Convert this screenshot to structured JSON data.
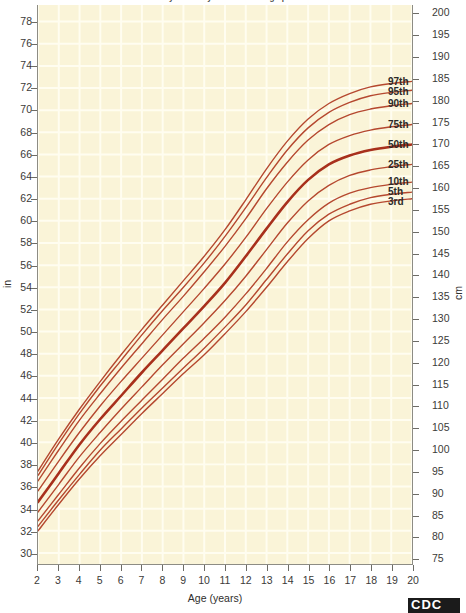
{
  "header": {
    "title": "2 to 20 years: Boys Stature-for-age percentiles",
    "logo_text": "CDC"
  },
  "axes": {
    "x_title": "Age (years)",
    "x_ticks": [
      2,
      3,
      4,
      5,
      6,
      7,
      8,
      9,
      10,
      11,
      12,
      13,
      14,
      15,
      16,
      17,
      18,
      19,
      20
    ],
    "x_min": 2,
    "x_max": 20,
    "left_unit": "in",
    "left_ticks": [
      78,
      76,
      74,
      72,
      70,
      68,
      66,
      64,
      62,
      60,
      58,
      56,
      54,
      52,
      50,
      48,
      46,
      44,
      42,
      40,
      38,
      36,
      34,
      32,
      30
    ],
    "left_min": 29,
    "left_max": 79.5,
    "right_unit": "cm",
    "right_ticks": [
      200,
      195,
      190,
      185,
      180,
      175,
      170,
      165,
      160,
      155,
      150,
      145,
      140,
      135,
      130,
      125,
      120,
      115,
      110,
      105,
      100,
      95,
      90,
      85,
      80,
      75
    ],
    "right_min": 73.7,
    "right_max": 201.9
  },
  "style": {
    "plot_background": "#faf4d8",
    "grid_color": "#fffdf0",
    "curve_color": "#b5482f",
    "curve_color_median": "#a8301c",
    "frame_color": "#8d8c84",
    "text_color": "#2f2e2c"
  },
  "chart_data": {
    "type": "line",
    "title": "2 to 20 years: Boys Stature-for-age percentiles",
    "xlabel": "Age (years)",
    "ylabel": "in",
    "ylabel_secondary": "cm",
    "xlim": [
      2,
      20
    ],
    "ylim": [
      29,
      79.5
    ],
    "grid": true,
    "legend": "inline-right",
    "x": [
      2,
      3,
      4,
      5,
      6,
      7,
      8,
      9,
      10,
      11,
      12,
      13,
      14,
      15,
      16,
      17,
      18,
      19,
      20
    ],
    "series": [
      {
        "name": "97th",
        "label": "97th",
        "emphasis": false,
        "values": [
          37.4,
          40.3,
          43.0,
          45.5,
          47.9,
          50.2,
          52.4,
          54.6,
          56.8,
          59.2,
          61.9,
          64.7,
          67.2,
          69.2,
          70.6,
          71.5,
          72.1,
          72.4,
          72.6
        ]
      },
      {
        "name": "95th",
        "label": "95th",
        "emphasis": false,
        "values": [
          37.0,
          39.9,
          42.6,
          45.1,
          47.4,
          49.7,
          51.9,
          54.0,
          56.2,
          58.6,
          61.2,
          63.9,
          66.4,
          68.4,
          69.8,
          70.7,
          71.3,
          71.6,
          71.8
        ]
      },
      {
        "name": "90th",
        "label": "90th",
        "emphasis": false,
        "values": [
          36.5,
          39.3,
          42.0,
          44.4,
          46.7,
          48.9,
          51.1,
          53.2,
          55.4,
          57.7,
          60.2,
          62.9,
          65.3,
          67.3,
          68.7,
          69.6,
          70.1,
          70.4,
          70.6
        ]
      },
      {
        "name": "75th",
        "label": "75th",
        "emphasis": false,
        "values": [
          35.6,
          38.3,
          40.9,
          43.3,
          45.5,
          47.6,
          49.7,
          51.8,
          53.9,
          56.1,
          58.5,
          61.1,
          63.5,
          65.5,
          66.9,
          67.7,
          68.2,
          68.5,
          68.7
        ]
      },
      {
        "name": "50th",
        "label": "50th",
        "emphasis": true,
        "values": [
          34.6,
          37.2,
          39.8,
          42.1,
          44.2,
          46.3,
          48.3,
          50.3,
          52.3,
          54.4,
          56.8,
          59.3,
          61.7,
          63.7,
          65.1,
          65.9,
          66.4,
          66.7,
          66.9
        ]
      },
      {
        "name": "25th",
        "label": "25th",
        "emphasis": false,
        "values": [
          33.7,
          36.2,
          38.7,
          40.9,
          43.0,
          45.0,
          47.0,
          48.9,
          50.8,
          52.8,
          55.0,
          57.4,
          59.8,
          61.8,
          63.2,
          64.1,
          64.6,
          64.9,
          65.1
        ]
      },
      {
        "name": "10th",
        "label": "10th",
        "emphasis": false,
        "values": [
          32.9,
          35.3,
          37.7,
          39.9,
          41.9,
          43.8,
          45.7,
          47.6,
          49.4,
          51.3,
          53.4,
          55.7,
          58.1,
          60.1,
          61.6,
          62.5,
          63.0,
          63.3,
          63.5
        ]
      },
      {
        "name": "5th",
        "label": "5th",
        "emphasis": false,
        "values": [
          32.4,
          34.8,
          37.1,
          39.3,
          41.2,
          43.1,
          44.9,
          46.7,
          48.5,
          50.4,
          52.4,
          54.7,
          57.0,
          59.1,
          60.6,
          61.5,
          62.1,
          62.4,
          62.6
        ]
      },
      {
        "name": "3rd",
        "label": "3rd",
        "emphasis": false,
        "values": [
          32.0,
          34.4,
          36.7,
          38.8,
          40.7,
          42.6,
          44.4,
          46.2,
          47.9,
          49.8,
          51.8,
          54.0,
          56.3,
          58.4,
          60.0,
          60.9,
          61.5,
          61.8,
          62.0
        ]
      }
    ]
  }
}
